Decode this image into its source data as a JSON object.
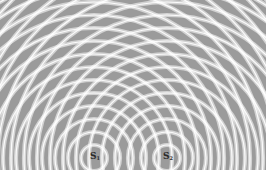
{
  "diagram": {
    "type": "two-source wave interference pattern",
    "colors": {
      "background": "#9b9b9b",
      "wavefront": "#ffffff",
      "label": "#2a2a2a",
      "margin": "#ffffff"
    },
    "wavelength_px": 13,
    "ring_count": 22,
    "sources": [
      {
        "id": "S1",
        "label": "S",
        "subscript": "1",
        "x": 94,
        "y": 158
      },
      {
        "id": "S2",
        "label": "S",
        "subscript": "2",
        "x": 167,
        "y": 158
      }
    ]
  }
}
